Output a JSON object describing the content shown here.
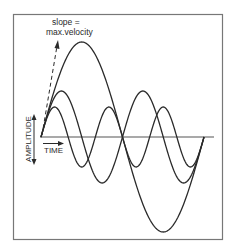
{
  "diagram": {
    "annotation_line1": "slope =",
    "annotation_line2": "max.velocity",
    "y_axis_label": "AMPLITUDE",
    "x_axis_label": "TIME",
    "colors": {
      "stroke": "#2a2a2a",
      "frame": "#777777",
      "background": "#ffffff"
    },
    "waves": [
      {
        "name": "large",
        "cycles": 1,
        "amplitude": 95
      },
      {
        "name": "medium",
        "cycles": 2,
        "amplitude": 46
      },
      {
        "name": "small",
        "cycles": 3,
        "amplitude": 30
      }
    ]
  }
}
